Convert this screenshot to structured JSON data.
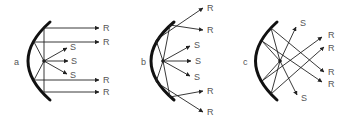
{
  "figure": {
    "panels": [
      {
        "label": "a",
        "description": "Parabolic mirror with source at focus: reflected rays parallel",
        "ray_labels": {
          "reflected": "R",
          "source": "S"
        },
        "reflected_count": 4,
        "source_count": 3
      },
      {
        "label": "b",
        "description": "Source inside focus: reflected rays diverge",
        "ray_labels": {
          "reflected": "R",
          "source": "S"
        },
        "reflected_count": 4,
        "source_count": 3
      },
      {
        "label": "c",
        "description": "Source beyond focus: reflected rays converge then cross",
        "ray_labels": {
          "reflected": "R",
          "source": "S"
        },
        "reflected_count": 4,
        "source_count": 2
      }
    ],
    "colors": {
      "line": "#222222",
      "mirror": "#111111",
      "text": "#555555",
      "background": "#ffffff"
    }
  }
}
